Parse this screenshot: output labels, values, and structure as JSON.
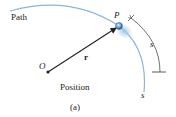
{
  "figure": {
    "caption": "(a)",
    "title": "Position",
    "labels": {
      "path": "Path",
      "particle": "P",
      "origin": "O",
      "position_vector": "r",
      "arc_length_dimension": "s",
      "path_coordinate": "s"
    },
    "colors": {
      "path_curve": "#8fb4d9",
      "particle": "#5b8fc4",
      "ink": "#222222"
    }
  }
}
